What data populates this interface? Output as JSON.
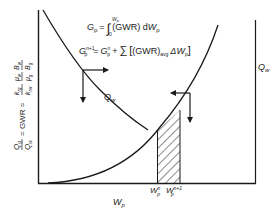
{
  "diagram": {
    "y_axis_label": {
      "lhs_num": "Q",
      "lhs_num_sub": "g",
      "lhs_den": "Q",
      "lhs_den_sub": "w",
      "eq1": "= GWR =",
      "k_num": "k",
      "k_num_sub": "rg",
      "k_den": "k",
      "k_den_sub": "rw",
      "mu_num": "μ",
      "mu_num_sub": "w",
      "mu_den": "μ",
      "mu_den_sub": "g",
      "b_num": "B",
      "b_num_sub": "w",
      "b_den": "B",
      "b_den_sub": "g"
    },
    "x_axis_label": {
      "main": "W",
      "sub": "p"
    },
    "right_axis_label": {
      "main": "Q",
      "sub": "w"
    },
    "curve_label": {
      "main": "Q",
      "sub": "w"
    },
    "equation1": {
      "lhs": "G",
      "lhs_sub": "p",
      "eq": "=",
      "integral": "∫",
      "lower": "0",
      "upper": "W",
      "upper_sub": "p",
      "body": "(GWR) d",
      "var": "W",
      "var_sub": "p"
    },
    "equation2": {
      "lhs": "G",
      "lhs_sub": "p",
      "lhs_sup": "n+1",
      "eq": "=",
      "term": "G",
      "term_sub": "p",
      "term_sup": "n",
      "plus": "+",
      "sum": "∑",
      "bracket_open": "[",
      "body": "(GWR)",
      "body_sub": "avg",
      "delta": "ΔW",
      "delta_sub": "p",
      "bracket_close": "]"
    },
    "tick_labels": [
      {
        "main": "W",
        "sub": "p",
        "sup": "n"
      },
      {
        "main": "W",
        "sub": "p",
        "sup": "n+1"
      }
    ],
    "colors": {
      "line": "#1a1a1a",
      "text": "#222222",
      "background": "#ffffff"
    }
  }
}
